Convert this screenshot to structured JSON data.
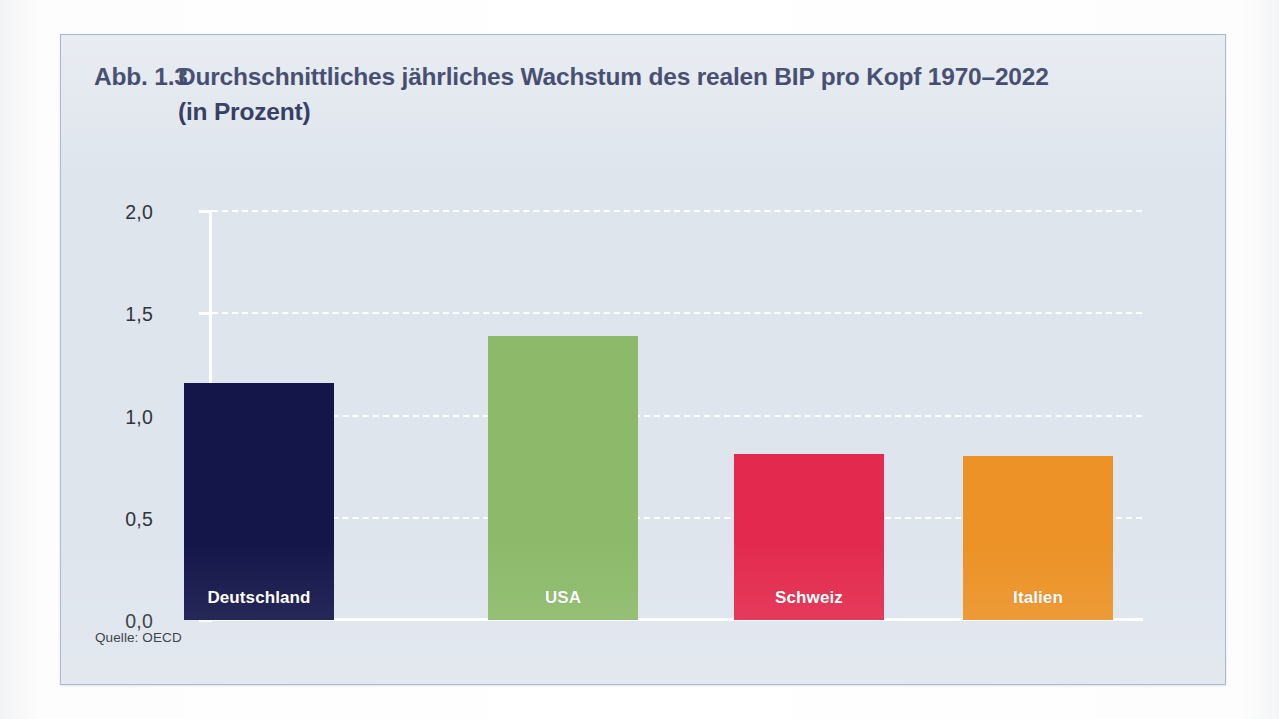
{
  "figure": {
    "number": "Abb. 1.3",
    "title_line1": "Durchschnittliches jährliches Wachstum des realen BIP pro Kopf 1970–2022",
    "title_line2": "(in Prozent)",
    "source": "Quelle: OECD",
    "panel_background": "#dfe5ed",
    "panel_border": "#a8bad2",
    "title_color": "#16214c",
    "gridline_color": "#ffffff"
  },
  "chart_data": {
    "type": "bar",
    "xlabel": "",
    "ylabel": "",
    "ylim": [
      0.0,
      2.0
    ],
    "ytick_labels": [
      "0,0",
      "0,5",
      "1,0",
      "1,5",
      "2,0"
    ],
    "ytick_values": [
      0.0,
      0.5,
      1.0,
      1.5,
      2.0
    ],
    "grid": true,
    "grid_style": "dashed-white-horizontal",
    "legend": "none",
    "categories": [
      "Deutschland",
      "USA",
      "Schweiz",
      "Italien"
    ],
    "values": [
      1.16,
      1.39,
      0.81,
      0.8
    ],
    "colors": [
      "#14164a",
      "#8cba6a",
      "#e32a4e",
      "#ec9226"
    ],
    "value_label_format": "german-decimal-comma",
    "source": "Quelle: OECD",
    "bars": [
      {
        "category": "Deutschland",
        "value": 1.16,
        "color": "#14164a",
        "label_color": "#ffffff"
      },
      {
        "category": "USA",
        "value": 1.39,
        "color": "#8cba6a",
        "label_color": "#ffffff"
      },
      {
        "category": "Schweiz",
        "value": 0.81,
        "color": "#e32a4e",
        "label_color": "#ffffff"
      },
      {
        "category": "Italien",
        "value": 0.8,
        "color": "#ec9226",
        "label_color": "#ffffff"
      }
    ]
  }
}
